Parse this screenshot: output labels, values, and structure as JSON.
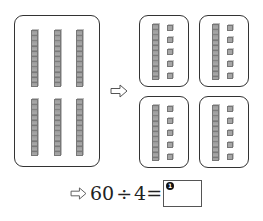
{
  "diagram": {
    "left_group": {
      "tens_rods": 6,
      "layout": "2 rows x 3 columns"
    },
    "arrow_icon": "right-arrow-outline",
    "right_groups": [
      {
        "tens_rods": 1,
        "ones_cubes": 5
      },
      {
        "tens_rods": 1,
        "ones_cubes": 5
      },
      {
        "tens_rods": 1,
        "ones_cubes": 5
      },
      {
        "tens_rods": 1,
        "ones_cubes": 5
      }
    ]
  },
  "equation": {
    "arrow_icon": "right-arrow-outline",
    "dividend": "60",
    "operator": "÷",
    "divisor": "4",
    "equals": "=",
    "answer_marker": "❶",
    "answer_value": ""
  }
}
